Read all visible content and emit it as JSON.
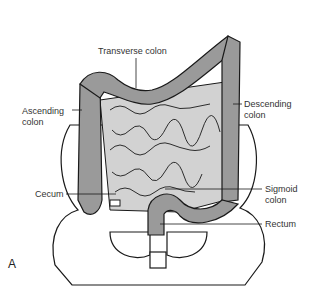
{
  "figure": {
    "panel_letter": "A",
    "labels": {
      "transverse": "Transverse colon",
      "ascending_1": "Ascending",
      "ascending_2": "colon",
      "descending_1": "Descending",
      "descending_2": "colon",
      "cecum": "Cecum",
      "sigmoid_1": "Sigmoid",
      "sigmoid_2": "colon",
      "rectum": "Rectum"
    },
    "colors": {
      "colon_fill": "#9a9a9a",
      "small_intestine_fill": "#d2d2d2",
      "bone_fill": "#ffffff",
      "outline": "#1a1a1a"
    }
  }
}
